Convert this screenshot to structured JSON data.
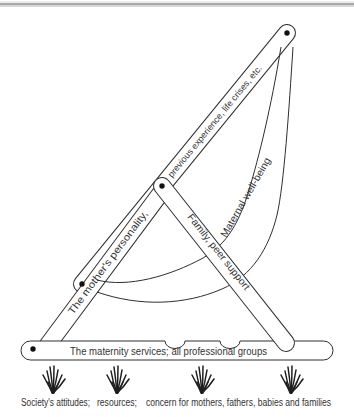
{
  "diagram": {
    "arms": {
      "previous_experience": "previous experience, life crises, etc.",
      "mothers_personality": "The mother's personality,",
      "family_peer_support": "Family, peer support"
    },
    "sling_label": "Maternal well-being",
    "base_bar_label": "The maternity services; all professional groups",
    "caption": {
      "attitudes": "Society's attitudes;",
      "resources": "resources;",
      "concern": "concern for mothers, fathers, babies and families"
    },
    "colors": {
      "line": "#2e2e2e",
      "text": "#333333",
      "dot": "#111111",
      "top_rule": "#a8a8a8",
      "background": "#ffffff"
    }
  }
}
